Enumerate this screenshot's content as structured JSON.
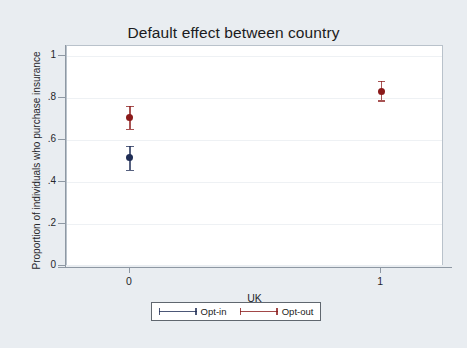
{
  "chart_data": {
    "type": "scatter",
    "title": "Default effect between country",
    "xlabel": "UK",
    "ylabel": "Proportion of individuals who purchase insurance",
    "xlim": [
      -0.25,
      1.25
    ],
    "ylim": [
      0,
      1.05
    ],
    "x": [
      0,
      1
    ],
    "xtick_labels": [
      "0",
      "1"
    ],
    "ytick_labels": [
      "0",
      ".2",
      ".4",
      ".6",
      ".8",
      "1"
    ],
    "ytick_values": [
      0,
      0.2,
      0.4,
      0.6,
      0.8,
      1
    ],
    "grid": true,
    "legend_position": "bottom",
    "series": [
      {
        "name": "Opt-in",
        "color": "#1f2d55",
        "points": [
          {
            "x": 0,
            "y": 0.52,
            "ci_low": 0.46,
            "ci_high": 0.575,
            "visible": true
          },
          {
            "x": 1,
            "y": null,
            "ci_low": null,
            "ci_high": null,
            "visible": false
          }
        ]
      },
      {
        "name": "Opt-out",
        "color": "#8b1a1a",
        "points": [
          {
            "x": 0,
            "y": 0.71,
            "ci_low": 0.655,
            "ci_high": 0.765,
            "visible": true
          },
          {
            "x": 1,
            "y": 0.835,
            "ci_low": 0.79,
            "ci_high": 0.885,
            "visible": true
          }
        ]
      }
    ]
  },
  "figure": {
    "background_color": "#e9edf1",
    "plot_background_color": "#ffffff",
    "axis_color": "#8e98a3",
    "grid_color": "#eef1f4"
  },
  "legend": {
    "entries": [
      {
        "label": "Opt-in",
        "color": "#1f2d55"
      },
      {
        "label": "Opt-out",
        "color": "#8b1a1a"
      }
    ]
  }
}
